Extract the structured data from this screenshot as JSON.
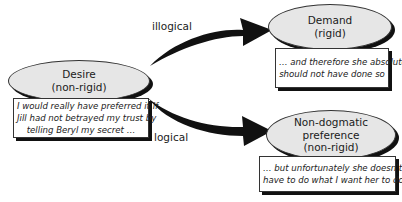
{
  "diagram": {
    "source_node": {
      "title": "Desire",
      "subtitle": "(non-rigid)",
      "quote_lines": [
        "I would really have preferred it if",
        "Jill had not betrayed my trust by",
        "telling Beryl my secret …"
      ]
    },
    "edges": [
      {
        "label": "illogical",
        "from": "Desire",
        "to": "Demand"
      },
      {
        "label": "logical",
        "from": "Desire",
        "to": "Non-dogmatic preference"
      }
    ],
    "target_nodes": [
      {
        "title_lines": [
          "Demand",
          "(rigid)"
        ],
        "quote_lines": [
          "… and therefore she absolutely",
          "should not have done so"
        ]
      },
      {
        "title_lines": [
          "Non-dogmatic",
          "preference",
          "(non-rigid)"
        ],
        "quote_lines": [
          "… but unfortunately she doesn't",
          "have to do what I want her to do"
        ]
      }
    ],
    "colors": {
      "node_fill": "#e6e6e6",
      "outline": "#333333",
      "arrow": "#111111",
      "quote_fill": "#ffffff"
    }
  }
}
